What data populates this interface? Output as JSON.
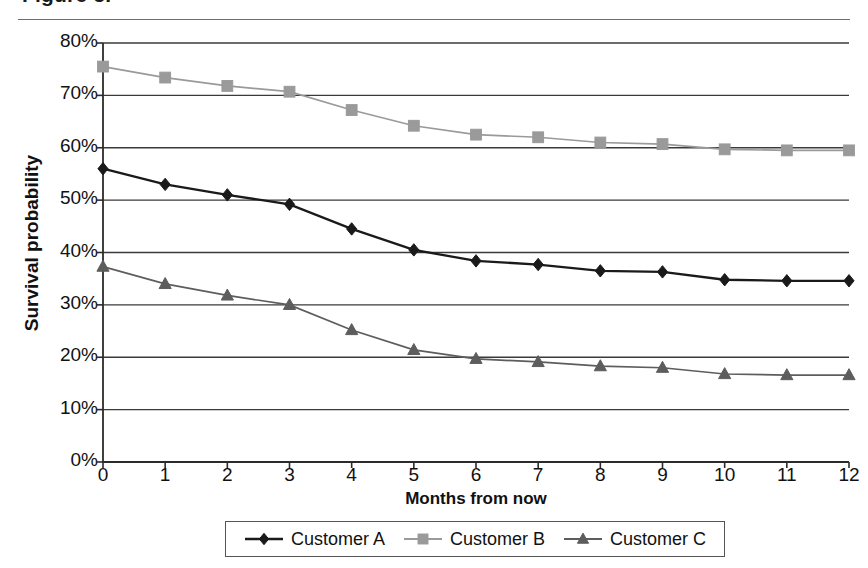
{
  "figure": {
    "title_partial": "Figure 5.",
    "ylabel": "Survival probability",
    "xlabel": "Months from now"
  },
  "legend": {
    "position": "bottom",
    "items": [
      {
        "label": "Customer A",
        "marker": "diamond",
        "color": "#1a1a1a"
      },
      {
        "label": "Customer B",
        "marker": "square",
        "color": "#9a9a9a"
      },
      {
        "label": "Customer C",
        "marker": "triangle",
        "color": "#5d5d5d"
      }
    ]
  },
  "axes": {
    "yticks": [
      "80%",
      "70%",
      "60%",
      "50%",
      "40%",
      "30%",
      "20%",
      "10%",
      "0%"
    ],
    "xticks": [
      "0",
      "1",
      "2",
      "3",
      "4",
      "5",
      "6",
      "7",
      "8",
      "9",
      "10",
      "11",
      "12"
    ]
  },
  "chart_data": {
    "type": "line",
    "title": "Figure 5.",
    "xlabel": "Months from now",
    "ylabel": "Survival probability",
    "x": [
      0,
      1,
      2,
      3,
      4,
      5,
      6,
      7,
      8,
      9,
      10,
      11,
      12
    ],
    "xlim": [
      0,
      12
    ],
    "ylim": [
      0,
      80
    ],
    "ytick_values": [
      0,
      10,
      20,
      30,
      40,
      50,
      60,
      70,
      80
    ],
    "ytick_suffix": "%",
    "grid": "horizontal",
    "legend_position": "bottom",
    "series": [
      {
        "name": "Customer A",
        "marker": "diamond",
        "color": "#1a1a1a",
        "values": [
          56.0,
          53.0,
          51.0,
          49.2,
          44.5,
          40.5,
          38.4,
          37.7,
          36.5,
          36.3,
          34.8,
          34.6,
          34.6
        ]
      },
      {
        "name": "Customer B",
        "marker": "square",
        "color": "#9a9a9a",
        "values": [
          75.5,
          73.4,
          71.8,
          70.7,
          67.2,
          64.2,
          62.5,
          62.0,
          61.0,
          60.7,
          59.7,
          59.5,
          59.5
        ]
      },
      {
        "name": "Customer C",
        "marker": "triangle",
        "color": "#5d5d5d",
        "values": [
          37.3,
          34.0,
          31.8,
          30.0,
          25.2,
          21.4,
          19.7,
          19.1,
          18.3,
          18.0,
          16.8,
          16.6,
          16.6
        ]
      }
    ]
  }
}
